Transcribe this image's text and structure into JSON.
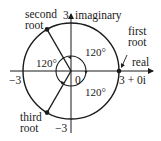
{
  "diagram": {
    "axes": {
      "real_label": "real",
      "imaginary_label": "imaginary",
      "tick_pos_imag": "3",
      "tick_neg_imag": "−3",
      "tick_neg_real": "−3",
      "origin_label": "0"
    },
    "circle_radius": 3,
    "roots": [
      {
        "name": "first root",
        "line1": "first",
        "line2": "root",
        "value_label": "3 + 0i",
        "angle_deg": 0
      },
      {
        "name": "second root",
        "line1": "second",
        "line2": "root",
        "angle_deg": 120
      },
      {
        "name": "third root",
        "line1": "third",
        "line2": "root",
        "angle_deg": 240
      }
    ],
    "angle_labels": [
      "120°",
      "120°",
      "120°"
    ],
    "colors": {
      "stroke": "#1a1a1a",
      "background": "#ffffff"
    }
  }
}
